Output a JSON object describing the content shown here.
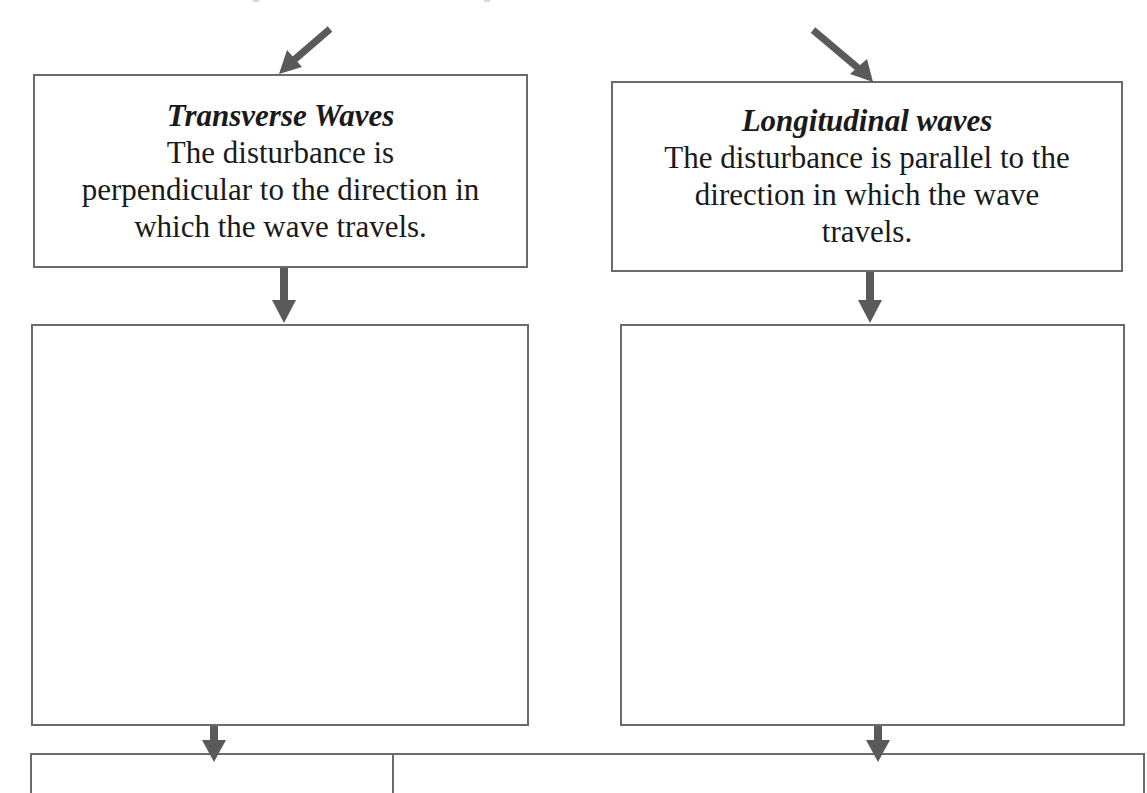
{
  "diagram": {
    "boxes": {
      "transverse": {
        "title": "Transverse Waves",
        "lines": [
          "The disturbance is",
          "perpendicular to the direction in",
          "which the wave travels."
        ]
      },
      "longitudinal": {
        "title": "Longitudinal waves",
        "lines": [
          "The disturbance is parallel to the",
          "direction in which the wave",
          "travels."
        ]
      },
      "transverse_answer": {
        "content": ""
      },
      "longitudinal_answer": {
        "content": ""
      }
    },
    "bottom_table": {
      "cells": [
        "",
        ""
      ]
    },
    "colors": {
      "border": "#6b6b6b",
      "arrow": "#5a5a5a",
      "text": "#1a1a1a",
      "background": "#ffffff"
    }
  }
}
